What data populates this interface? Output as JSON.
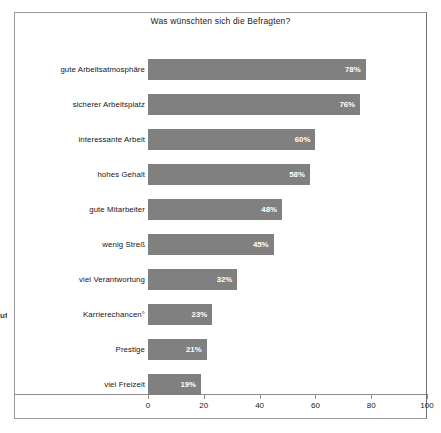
{
  "chart_data": {
    "type": "bar",
    "orientation": "horizontal",
    "title": "Was wünschten sich die Befragten?",
    "xlabel": "",
    "ylabel": "",
    "xlim": [
      0,
      100
    ],
    "xticks": [
      0,
      20,
      40,
      60,
      80,
      100
    ],
    "grid": false,
    "legend": null,
    "bar_color": "#808080",
    "value_suffix": "%",
    "categories": [
      "gute Arbeitsatmosphäre",
      "sicherer Arbeitsplatz",
      "interessante Arbeit",
      "hohes Gehalt",
      "gute Mitarbeiter",
      "wenig Streß",
      "viel Verantwortung",
      "Karrierechancen°",
      "Prestige",
      "viel Freizeit"
    ],
    "values": [
      78,
      76,
      60,
      58,
      48,
      45,
      32,
      23,
      21,
      19
    ],
    "value_labels": [
      "78%",
      "76%",
      "60%",
      "58%",
      "48%",
      "45%",
      "32%",
      "23%",
      "21%",
      "19%"
    ]
  },
  "margin_artifact": "uf"
}
